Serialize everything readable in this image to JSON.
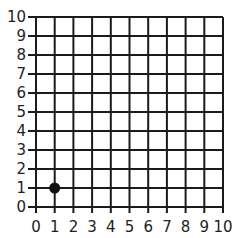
{
  "chart_data": {
    "type": "scatter",
    "title": "",
    "xlabel": "",
    "ylabel": "",
    "xlim": [
      0,
      10
    ],
    "ylim": [
      0,
      10
    ],
    "grid": true,
    "x_ticks": [
      "0",
      "1",
      "2",
      "3",
      "4",
      "5",
      "6",
      "7",
      "8",
      "9",
      "10"
    ],
    "y_ticks": [
      "0",
      "1",
      "2",
      "3",
      "4",
      "5",
      "6",
      "7",
      "8",
      "9",
      "10"
    ],
    "points": [
      {
        "x": 1,
        "y": 1
      }
    ],
    "colors": {
      "grid": "#1a1a1a",
      "point": "#111111"
    }
  }
}
